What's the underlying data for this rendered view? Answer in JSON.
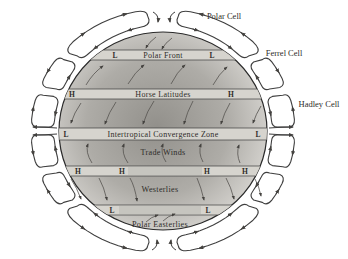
{
  "diagram": {
    "cells": [
      {
        "label": "Polar Cell"
      },
      {
        "label": "Ferrel Cell"
      },
      {
        "label": "Hadley Cell"
      }
    ],
    "bands": [
      {
        "id": "polar-front",
        "label": "Polar Front",
        "markers": [
          "L",
          "L"
        ]
      },
      {
        "id": "horse-latitudes",
        "label": "Horse Latitudes",
        "markers": [
          "H",
          "H"
        ]
      },
      {
        "id": "itcz",
        "label": "Intertropical Convergence Zone",
        "markers": [
          "L",
          "L"
        ]
      },
      {
        "id": "subtropical-high-south",
        "label": "",
        "markers": [
          "H",
          "H",
          "H",
          "H"
        ]
      },
      {
        "id": "subpolar-low-south",
        "label": "",
        "markers": [
          "L",
          "L"
        ]
      }
    ],
    "zones": [
      {
        "label": "Trade Winds"
      },
      {
        "label": "Westerlies"
      },
      {
        "label": "Polar Easterlies"
      }
    ],
    "colors": {
      "globe_center": "#92908b",
      "globe_mid": "#aeaca7",
      "globe_edge": "#e0deda",
      "band_fill": "#d6d4ce",
      "outline": "#3c3c3c",
      "arrow": "#55534f",
      "text": "#2e2c29"
    }
  }
}
